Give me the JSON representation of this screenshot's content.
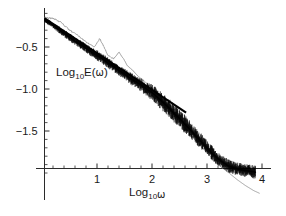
{
  "figure": {
    "background_color": "#ffffff",
    "width": 286,
    "height": 216,
    "y_axis_label_main": "Log",
    "y_axis_label_sub": "10",
    "y_axis_label_tail": "E(",
    "y_axis_label_omega": "ω",
    "y_axis_label_close": ")",
    "x_axis_label_main": "Log",
    "x_axis_label_sub": "10",
    "x_axis_label_omega": "ω",
    "data_color": "#000000",
    "theory_color": "#8a8a8a",
    "axis_color": "#2b2b2b"
  },
  "chart_data": {
    "type": "line",
    "title": "",
    "xlabel": "Log10ω",
    "ylabel": "Log10E(ω)",
    "xlim": [
      0.0,
      4.0
    ],
    "ylim": [
      -2.2,
      -0.05
    ],
    "grid": false,
    "legend": "none",
    "xticks": [
      1,
      2,
      3,
      4
    ],
    "xtick_labels": [
      "1",
      "2",
      "3",
      "4"
    ],
    "x_minor_ticks_per_major": 5,
    "yticks": [
      -0.5,
      -1.0,
      -1.5
    ],
    "ytick_labels": [
      "-0.5",
      "-1.0",
      "-1.5"
    ],
    "y_minor_ticks_per_major": 5,
    "series": [
      {
        "name": "measured-spectrum",
        "style": "noisy-thick-black",
        "color": "#000000",
        "x": [
          0.05,
          0.15,
          0.3,
          0.45,
          0.6,
          0.75,
          0.9,
          1.0,
          1.1,
          1.2,
          1.3,
          1.4,
          1.5,
          1.6,
          1.7,
          1.8,
          1.9,
          2.0,
          2.1,
          2.2,
          2.3,
          2.4,
          2.5,
          2.6,
          2.7,
          2.8,
          2.9,
          3.0,
          3.1,
          3.2,
          3.3,
          3.4,
          3.5,
          3.6,
          3.7,
          3.8,
          3.88
        ],
        "y": [
          -0.18,
          -0.22,
          -0.29,
          -0.36,
          -0.43,
          -0.49,
          -0.56,
          -0.6,
          -0.64,
          -0.69,
          -0.73,
          -0.78,
          -0.82,
          -0.87,
          -0.91,
          -0.95,
          -1.0,
          -1.04,
          -1.1,
          -1.16,
          -1.22,
          -1.29,
          -1.35,
          -1.42,
          -1.49,
          -1.56,
          -1.63,
          -1.7,
          -1.77,
          -1.83,
          -1.88,
          -1.92,
          -1.94,
          -1.96,
          -1.97,
          -1.98,
          -1.99
        ],
        "noise_amplitude": [
          0.02,
          0.02,
          0.025,
          0.03,
          0.03,
          0.03,
          0.035,
          0.04,
          0.04,
          0.04,
          0.04,
          0.04,
          0.04,
          0.045,
          0.05,
          0.05,
          0.055,
          0.06,
          0.065,
          0.07,
          0.07,
          0.07,
          0.07,
          0.07,
          0.065,
          0.06,
          0.06,
          0.055,
          0.055,
          0.05,
          0.05,
          0.05,
          0.05,
          0.05,
          0.05,
          0.05,
          0.05
        ]
      },
      {
        "name": "model-spectrum",
        "style": "thin-gray-spiky",
        "color": "#8a8a8a",
        "x": [
          0.05,
          0.2,
          0.35,
          0.5,
          0.65,
          0.8,
          0.95,
          1.05,
          1.12,
          1.2,
          1.3,
          1.4,
          1.5,
          1.55,
          1.65,
          1.75,
          1.85,
          1.95,
          2.05,
          2.2,
          2.4,
          2.6,
          2.8,
          3.0,
          3.2,
          3.4,
          3.55,
          3.7,
          3.85,
          3.95
        ],
        "y": [
          -0.15,
          -0.16,
          -0.21,
          -0.3,
          -0.36,
          -0.44,
          -0.5,
          -0.4,
          -0.49,
          -0.6,
          -0.64,
          -0.56,
          -0.66,
          -0.72,
          -0.78,
          -0.85,
          -0.9,
          -0.96,
          -1.02,
          -1.14,
          -1.3,
          -1.46,
          -1.62,
          -1.76,
          -1.9,
          -2.0,
          -2.08,
          -2.15,
          -2.21,
          -2.24
        ]
      },
      {
        "name": "power-law-fit-line",
        "style": "thick-straight-black",
        "color": "#000000",
        "x": [
          0.05,
          2.62
        ],
        "y": [
          -0.16,
          -1.28
        ]
      }
    ],
    "annotations": []
  }
}
